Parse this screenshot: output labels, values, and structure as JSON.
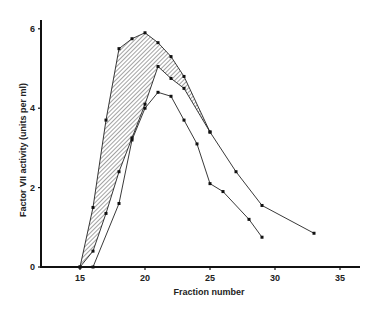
{
  "chart_data": {
    "type": "line",
    "title": "",
    "xlabel": "Fraction number",
    "ylabel": "Factor VII activity (units per ml)",
    "xlim": [
      12,
      36.5
    ],
    "ylim": [
      0,
      6.4
    ],
    "xticks": [
      15,
      20,
      25,
      30,
      35
    ],
    "yticks": [
      0,
      2,
      4,
      6
    ],
    "grid": false,
    "legend": null,
    "annotations": [
      "Hatched area between upper and middle curves"
    ],
    "series": [
      {
        "name": "upper",
        "x": [
          15,
          16,
          17,
          18,
          19,
          20,
          21,
          22,
          23,
          25,
          27,
          29,
          33
        ],
        "y": [
          0,
          1.5,
          3.7,
          5.5,
          5.75,
          5.9,
          5.65,
          5.3,
          4.8,
          3.4,
          2.4,
          1.55,
          0.85
        ]
      },
      {
        "name": "middle",
        "x": [
          15,
          16,
          17,
          18,
          19,
          20,
          21,
          22,
          23,
          25
        ],
        "y": [
          0,
          0.4,
          1.35,
          2.4,
          3.25,
          4.1,
          5.05,
          4.75,
          4.5,
          3.4
        ]
      },
      {
        "name": "lower",
        "x": [
          16,
          18,
          19,
          20,
          21,
          22,
          23,
          24,
          25,
          26,
          28,
          29
        ],
        "y": [
          0,
          1.6,
          3.2,
          4.0,
          4.4,
          4.3,
          3.7,
          3.1,
          2.1,
          1.9,
          1.2,
          0.75
        ]
      }
    ]
  }
}
